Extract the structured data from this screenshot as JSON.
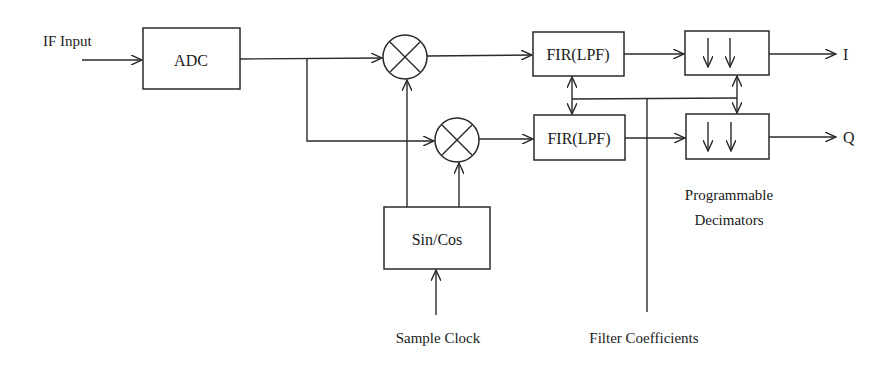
{
  "diagram": {
    "type": "block-diagram",
    "colors": {
      "stroke": "#2a2a2a",
      "text": "#1a1a1a",
      "background": "#ffffff"
    },
    "labels": {
      "if_input": "IF Input",
      "adc": "ADC",
      "sincos": "Sin/Cos",
      "sample_clock": "Sample Clock",
      "fir_top": "FIR(LPF)",
      "fir_bottom": "FIR(LPF)",
      "filter_coefficients": "Filter Coefficients",
      "decimators_line1": "Programmable",
      "decimators_line2": "Decimators",
      "output_i": "I",
      "output_q": "Q"
    },
    "nodes": [
      {
        "id": "adc",
        "label": "ADC",
        "kind": "block"
      },
      {
        "id": "mixer_i",
        "label": "⊗",
        "kind": "multiplier"
      },
      {
        "id": "mixer_q",
        "label": "⊗",
        "kind": "multiplier"
      },
      {
        "id": "sincos",
        "label": "Sin/Cos",
        "kind": "block"
      },
      {
        "id": "fir_i",
        "label": "FIR(LPF)",
        "kind": "block"
      },
      {
        "id": "fir_q",
        "label": "FIR(LPF)",
        "kind": "block"
      },
      {
        "id": "dec_i",
        "label": "↓ ↓",
        "kind": "decimator"
      },
      {
        "id": "dec_q",
        "label": "↓ ↓",
        "kind": "decimator"
      }
    ],
    "edges": [
      {
        "from": "IF Input",
        "to": "adc"
      },
      {
        "from": "adc",
        "to": "mixer_i"
      },
      {
        "from": "adc",
        "to": "mixer_q"
      },
      {
        "from": "sincos",
        "to": "mixer_i"
      },
      {
        "from": "sincos",
        "to": "mixer_q"
      },
      {
        "from": "Sample Clock",
        "to": "sincos"
      },
      {
        "from": "mixer_i",
        "to": "fir_i"
      },
      {
        "from": "mixer_q",
        "to": "fir_q"
      },
      {
        "from": "fir_i",
        "to": "dec_i"
      },
      {
        "from": "fir_q",
        "to": "dec_q"
      },
      {
        "from": "dec_i",
        "to": "I"
      },
      {
        "from": "dec_q",
        "to": "Q"
      },
      {
        "from": "Filter Coefficients",
        "to": "fir_i",
        "bidirectional": true
      },
      {
        "from": "Filter Coefficients",
        "to": "fir_q",
        "bidirectional": true
      },
      {
        "from": "Filter Coefficients",
        "to": "dec_i",
        "bidirectional": true
      },
      {
        "from": "Filter Coefficients",
        "to": "dec_q",
        "bidirectional": true
      }
    ]
  }
}
